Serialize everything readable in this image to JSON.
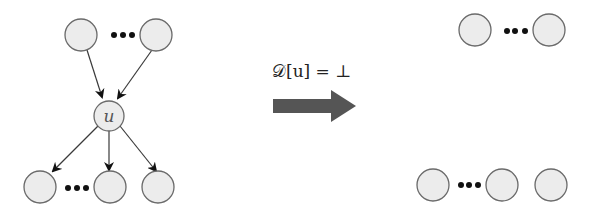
{
  "diagram": {
    "center_node_label": "u",
    "transition_label": "𝒟[u] = ⊥",
    "ellipsis": "•••",
    "colors": {
      "node_fill": "#ececec",
      "node_stroke": "#6a6a6a",
      "edge": "#3a3a3a",
      "arrow": "#555555"
    },
    "left_graph": {
      "parents": [
        "parent-1",
        "parent-n"
      ],
      "center": "u",
      "children": [
        "child-1",
        "child-k",
        "child-last"
      ]
    },
    "right_graph": {
      "parents": [
        "parent-1",
        "parent-n"
      ],
      "children": [
        "child-1",
        "child-k",
        "child-last"
      ]
    }
  }
}
